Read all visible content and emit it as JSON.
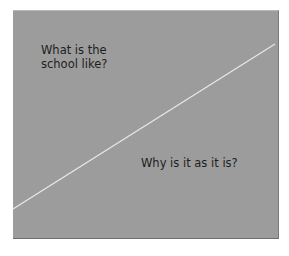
{
  "diagram": {
    "background_color": "#9c9c9c",
    "divider_color": "#e8e8e8",
    "regions": [
      {
        "label": "What is the school like?",
        "position": "upper-left"
      },
      {
        "label": "Why is it as it is?",
        "position": "lower-right"
      }
    ]
  }
}
